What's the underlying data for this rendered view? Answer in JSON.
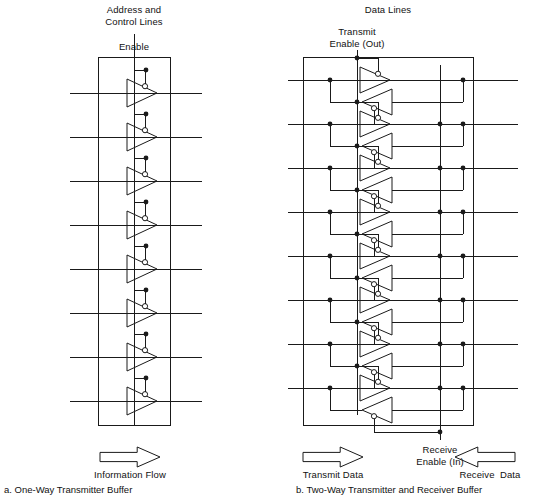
{
  "figure": {
    "title_left": "a. One-Way Transmitter Buffer",
    "title_right": "b. Two-Way Transmitter and Receiver Buffer",
    "line_color": "#1a1a1a",
    "background": "#ffffff"
  },
  "left_panel": {
    "header": "Address and\nControl Lines",
    "enable_label": "Enable",
    "flow_label": "Information Flow",
    "caption": "a. One-Way Transmitter Buffer",
    "buffer_count": 8,
    "box": {
      "x": 98,
      "y": 57,
      "w": 72,
      "h": 368
    },
    "line_x_start": 70,
    "line_x_end": 202,
    "enable_x": 134,
    "enable_y_top": 34,
    "first_line_y": 93,
    "line_spacing": 44,
    "arrow": {
      "x": 100,
      "y": 447,
      "w": 60,
      "h": 20,
      "dir": "right"
    }
  },
  "right_panel": {
    "header": "Data Lines",
    "transmit_enable_label": "Transmit\nEnable (Out)",
    "receive_enable_label": "Receive\nEnable (In)",
    "transmit_data_label": "Transmit Data",
    "receive_data_label": "Receive  Data",
    "caption": "b. Two-Way Transmitter and Receiver Buffer",
    "pair_count": 8,
    "box": {
      "x": 303,
      "y": 57,
      "w": 170,
      "h": 368
    },
    "line_x_start": 288,
    "line_x_end": 518,
    "tx_enable_x": 357,
    "tx_enable_y_top": 57,
    "rx_enable_x": 440,
    "rx_enable_y_bottom": 440,
    "first_line_y": 80,
    "line_spacing": 44,
    "arrow_tx": {
      "x": 303,
      "y": 447,
      "w": 60,
      "h": 20,
      "dir": "right"
    },
    "arrow_rx": {
      "x": 455,
      "y": 447,
      "w": 60,
      "h": 20,
      "dir": "left"
    }
  },
  "icons": {
    "buffer": "tri-buffer-icon",
    "bubble": "enable-bubble-icon",
    "junction": "junction-dot-icon",
    "arrow_right": "arrow-right-icon",
    "arrow_left": "arrow-left-icon"
  }
}
